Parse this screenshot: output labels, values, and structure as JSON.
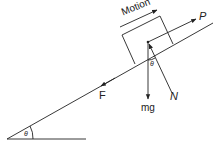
{
  "diagram": {
    "labels": {
      "motion": "Motion",
      "push_force": "P",
      "friction": "F",
      "weight": "mg",
      "normal": "N",
      "angle_base": "θ",
      "angle_block": "θ"
    },
    "colors": {
      "line": "#222222",
      "background": "#ffffff"
    }
  }
}
